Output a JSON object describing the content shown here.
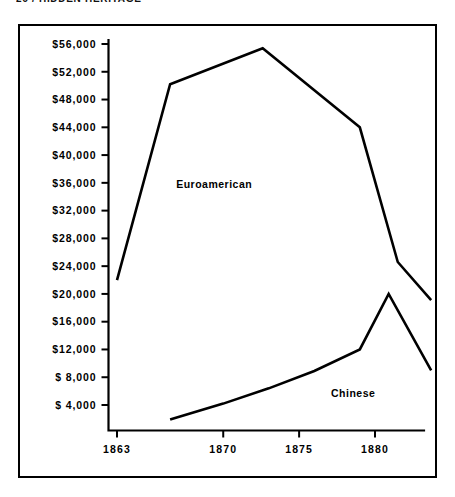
{
  "page": {
    "running_head": "26 / HIDDEN HERITAGE"
  },
  "figure": {
    "frame_color": "#000000",
    "background_color": "#ffffff"
  },
  "chart_data": {
    "type": "line",
    "title": "",
    "subtitle": "",
    "xlabel": "",
    "ylabel": "",
    "grid": false,
    "legend": "inline-annotation",
    "xlim": [
      1862,
      1884
    ],
    "ylim": [
      0,
      58000
    ],
    "x_tick_labels": [
      "1863",
      "1870",
      "1875",
      "1880"
    ],
    "x_tick_values": [
      1863,
      1870,
      1875,
      1880
    ],
    "y_tick_labels": [
      "$56,000",
      "$52,000",
      "$48,000",
      "$44,000",
      "$40,000",
      "$36,000",
      "$32,000",
      "$28,000",
      "$24,000",
      "$20,000",
      "$16,000",
      "$12,000",
      "$ 8,000",
      "$ 4,000"
    ],
    "y_tick_values": [
      56000,
      52000,
      48000,
      44000,
      40000,
      36000,
      32000,
      28000,
      24000,
      20000,
      16000,
      12000,
      8000,
      4000
    ],
    "series": [
      {
        "name": "Euroamerican",
        "label": "Euroamerican",
        "label_x": 1866.9,
        "label_y": 35200,
        "color": "#000000",
        "points": [
          [
            1863.0,
            22000
          ],
          [
            1866.5,
            50200
          ],
          [
            1872.6,
            55400
          ],
          [
            1879.0,
            44000
          ],
          [
            1881.5,
            24600
          ],
          [
            1883.7,
            19100
          ]
        ]
      },
      {
        "name": "Chinese",
        "label": "Chinese",
        "label_x": 1877.1,
        "label_y": 5200,
        "color": "#000000",
        "points": [
          [
            1866.5,
            1900
          ],
          [
            1870.0,
            4200
          ],
          [
            1873.0,
            6400
          ],
          [
            1876.0,
            8900
          ],
          [
            1879.0,
            12000
          ],
          [
            1880.9,
            20000
          ],
          [
            1883.7,
            9000
          ]
        ]
      }
    ]
  }
}
